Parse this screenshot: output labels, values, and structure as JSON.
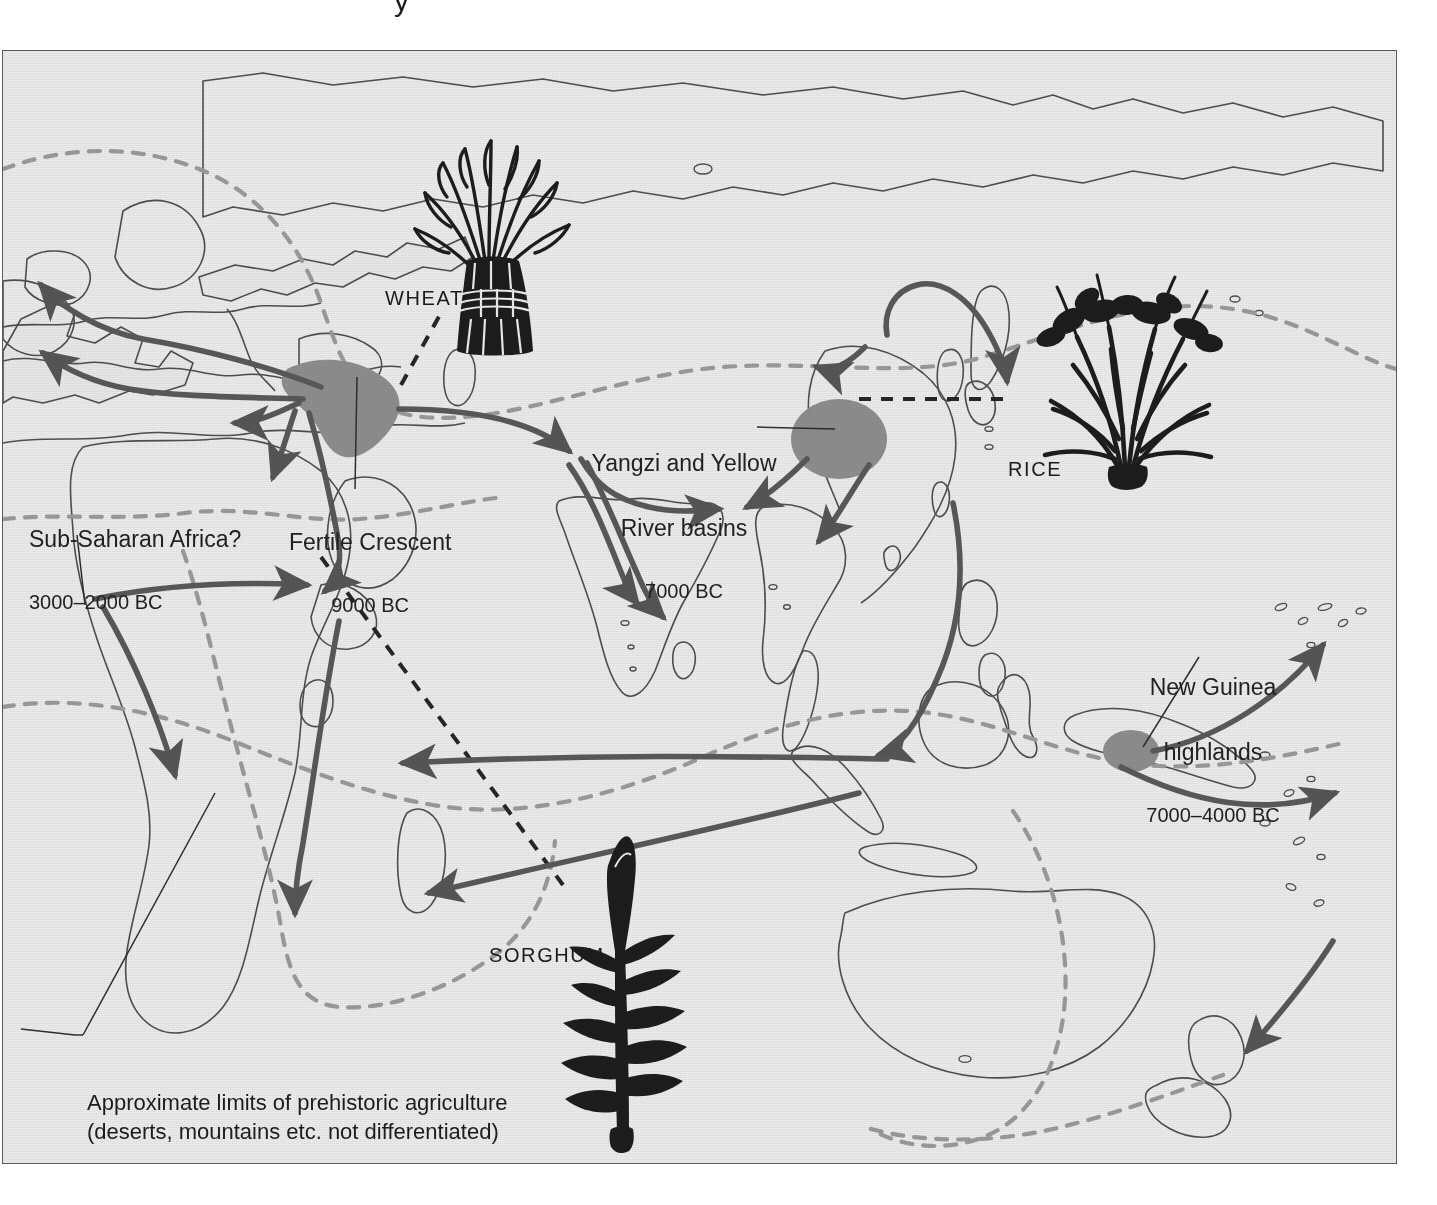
{
  "figure": {
    "title_fragment": "y",
    "paper_color": "#ececec",
    "frame_color": "#5a5a5a",
    "land_outline_color": "#4a4a4a",
    "arrow_color": "#595959",
    "dashed_limit_color": "#9a9a9a",
    "origin_blob_color": "#8c8c8c",
    "sea_color": "#ececec"
  },
  "regions": [
    {
      "id": "fertile-crescent",
      "place": "Fertile Crescent",
      "date": "9000 BC",
      "x": 286,
      "y": 440
    },
    {
      "id": "yangzi-yellow",
      "place_line1": "Yangzi and Yellow",
      "place_line2": "River basins",
      "date": "7000 BC",
      "x": 586,
      "y": 361
    },
    {
      "id": "sub-saharan-africa",
      "place": "Sub-Saharan Africa?",
      "date": "3000–2000 BC",
      "x": 26,
      "y": 437
    },
    {
      "id": "new-guinea-highlands",
      "place_line1": "New Guinea",
      "place_line2": "highlands",
      "date": "7000–4000 BC",
      "x": 1130,
      "y": 585
    }
  ],
  "crops": [
    {
      "id": "wheat",
      "label": "WHEAT",
      "x": 382,
      "y": 236
    },
    {
      "id": "rice",
      "label": "RICE",
      "x": 1005,
      "y": 407
    },
    {
      "id": "sorghum",
      "label": "SORGHUM",
      "x": 486,
      "y": 893
    }
  ],
  "legend": {
    "line1": "Approximate limits of prehistoric agriculture",
    "line2": "(deserts, mountains etc. not differentiated)",
    "x": 84,
    "y": 1038
  },
  "map_data": {
    "type": "thematic-diffusion-map",
    "projection": "world-eastern-hemisphere",
    "origin_centres": [
      {
        "name": "Fertile Crescent",
        "date": "9000 BC",
        "crop": "wheat"
      },
      {
        "name": "Yangzi and Yellow River basins",
        "date": "7000 BC",
        "crop": "rice"
      },
      {
        "name": "New Guinea highlands",
        "date": "7000–4000 BC"
      },
      {
        "name": "Sub-Saharan Africa?",
        "date": "3000–2000 BC",
        "crop": "sorghum"
      }
    ],
    "diffusion_arrows": [
      "Fertile Crescent → western Europe / Britain",
      "Fertile Crescent → western Mediterranean",
      "Fertile Crescent → Egypt / Nile",
      "Fertile Crescent → Arabia",
      "Fertile Crescent → Central Asia → India",
      "Central Asia → southern India",
      "Yangzi / Yellow basins → Korea and Japan",
      "Yangzi / Yellow basins → Southeast Asia",
      "Yangzi / Yellow basins → northeast India",
      "South China → Island Southeast Asia → Indonesia",
      "Island Southeast Asia → Madagascar / East Africa",
      "New Guinea → Pacific islands",
      "Pacific → New Zealand",
      "Sub-Saharan Africa → southern Africa"
    ],
    "legend_series": [
      {
        "style": "grey-dashed",
        "meaning": "Approximate limits of prehistoric agriculture (deserts, mountains etc. not differentiated)"
      },
      {
        "style": "black-dashed-leader",
        "meaning": "crop illustration leader line"
      },
      {
        "style": "grey-blob",
        "meaning": "origin centre of domestication"
      }
    ]
  }
}
